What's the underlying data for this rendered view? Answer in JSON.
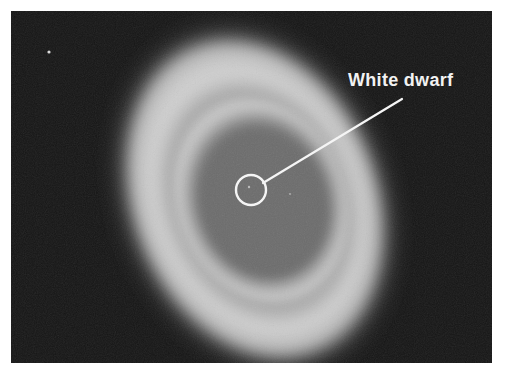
{
  "image": {
    "subject": "ring nebula photograph",
    "background_color": "#141414"
  },
  "annotation": {
    "label": "White dwarf",
    "color": "#f2f2f2"
  }
}
